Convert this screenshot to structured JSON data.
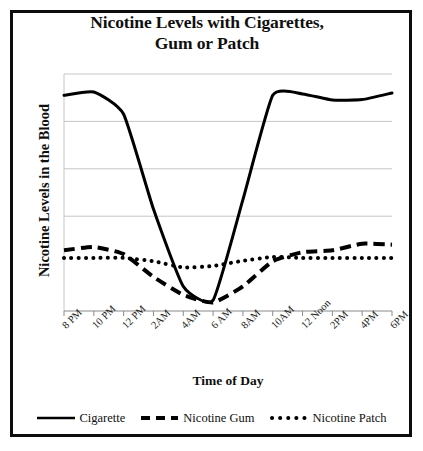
{
  "chart_data": {
    "type": "line",
    "title": "Nicotine Levels with Cigarettes,\nGum  or Patch",
    "xlabel": "Time of Day",
    "ylabel": "Nicotine Levels in the Blood",
    "grid": "horizontal",
    "legend_position": "bottom",
    "ylim": [
      0,
      5
    ],
    "y_gridline_values": [
      5,
      4,
      3,
      2
    ],
    "y_tick_labels": [],
    "categories": [
      "8 PM",
      "10 PM",
      "12 PM",
      "2AM",
      "4AM",
      "6 AM",
      "8AM",
      "10AM",
      "12 Noon",
      "2PM",
      "4PM",
      "6PM"
    ],
    "x": [
      0,
      1,
      2,
      3,
      4,
      5,
      6,
      7,
      8,
      9,
      10,
      11
    ],
    "series": [
      {
        "name": "Cigarette",
        "style": "solid",
        "color": "#000000",
        "values": [
          4.55,
          4.62,
          4.15,
          2.15,
          0.52,
          0.23,
          2.35,
          4.55,
          4.58,
          4.45,
          4.46,
          4.6
        ]
      },
      {
        "name": "Nicotine Gum",
        "style": "dashed",
        "color": "#000000",
        "values": [
          1.28,
          1.35,
          1.2,
          0.72,
          0.34,
          0.18,
          0.52,
          1.05,
          1.24,
          1.28,
          1.42,
          1.4
        ]
      },
      {
        "name": "Nicotine Patch",
        "style": "dotted",
        "color": "#000000",
        "values": [
          1.12,
          1.12,
          1.12,
          1.05,
          0.92,
          0.95,
          1.06,
          1.14,
          1.12,
          1.12,
          1.12,
          1.12
        ]
      }
    ]
  },
  "legend": {
    "items": [
      {
        "label": "Cigarette",
        "marker": "solid-line-marker"
      },
      {
        "label": "Nicotine Gum",
        "marker": "dashed-line-marker"
      },
      {
        "label": "Nicotine Patch",
        "marker": "dotted-line-marker"
      }
    ]
  }
}
